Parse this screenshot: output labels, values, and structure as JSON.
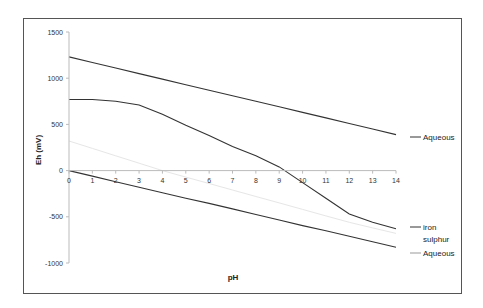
{
  "chart_data": {
    "type": "line",
    "title": "",
    "xlabel": "pH",
    "ylabel": "Eh (mV)",
    "xlim": [
      0,
      14
    ],
    "ylim": [
      -1000,
      1500
    ],
    "x_ticks": [
      "0",
      "1",
      "2",
      "3",
      "4",
      "5",
      "6",
      "7",
      "8",
      "9",
      "10",
      "11",
      "12",
      "13",
      "14"
    ],
    "y_ticks": [
      "1500",
      "1000",
      "500",
      "0",
      "-500",
      "-1000"
    ],
    "y_tick_values": [
      1500,
      1000,
      500,
      0,
      -500,
      -1000
    ],
    "grid": false,
    "legend_position": "right",
    "x": [
      0,
      1,
      2,
      3,
      4,
      5,
      6,
      7,
      8,
      9,
      10,
      11,
      12,
      13,
      14
    ],
    "series": [
      {
        "name": "Aqueous",
        "color": "#333333",
        "values": [
          1230,
          1170,
          1110,
          1050,
          990,
          930,
          870,
          810,
          750,
          690,
          630,
          570,
          510,
          450,
          390
        ]
      },
      {
        "name": "iron sulphur",
        "color": "#333333",
        "values": [
          770,
          770,
          750,
          710,
          610,
          490,
          380,
          260,
          160,
          40,
          -130,
          -300,
          -470,
          -560,
          -630
        ]
      },
      {
        "name": "iron sulphur (light)",
        "color": "#e6e6e6",
        "values": [
          320,
          240,
          160,
          80,
          0,
          -70,
          -140,
          -210,
          -280,
          -350,
          -420,
          -490,
          -560,
          -620,
          -680
        ]
      },
      {
        "name": "Aqueous",
        "color": "#333333",
        "values": [
          0,
          -60,
          -120,
          -180,
          -240,
          -300,
          -355,
          -415,
          -475,
          -535,
          -595,
          -650,
          -710,
          -770,
          -830
        ]
      }
    ],
    "legend": [
      "Aqueous",
      "iron sulphur",
      "Aqueous"
    ]
  },
  "legend": {
    "items": [
      {
        "label": "Aqueous"
      },
      {
        "label_line1": "iron",
        "label_line2": "sulphur"
      },
      {
        "label": "Aqueous"
      }
    ]
  }
}
